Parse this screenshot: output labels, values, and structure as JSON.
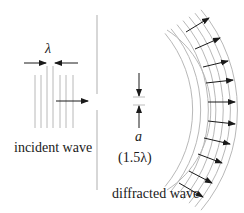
{
  "labels": {
    "lambda": "λ",
    "incident": "incident wave",
    "a": "a",
    "slit_width": "(1.5λ)",
    "diffracted": "diffracted wave"
  },
  "colors": {
    "wave_line": "#b8b8b8",
    "barrier": "#bdbdbd",
    "arrow": "#1a1a1a",
    "text": "#1a1a1a"
  },
  "incident_wave": {
    "line_x": [
      35,
      41,
      47,
      53,
      60,
      66,
      73
    ],
    "y_top": 75,
    "y_bottom": 128
  },
  "barrier": {
    "x": 97,
    "top_segment": [
      15,
      68
    ],
    "bottom_segment": [
      80,
      190
    ]
  },
  "diffracted_wave": {
    "arc_count": 7,
    "arrow_count": 12
  }
}
